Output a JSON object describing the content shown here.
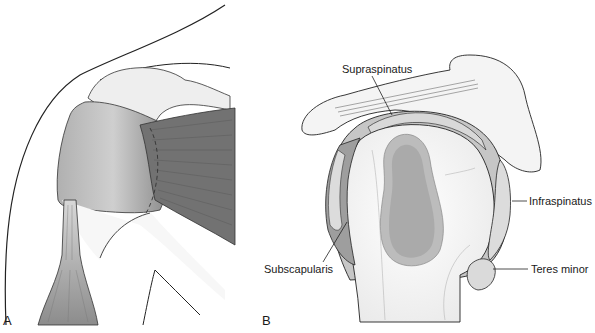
{
  "figure": {
    "panels": [
      {
        "letter": "A",
        "view": "anterior shoulder musculature"
      },
      {
        "letter": "B",
        "view": "lateral view of humeral head with rotator cuff"
      }
    ],
    "labels": {
      "supraspinatus": "Supraspinatus",
      "infraspinatus": "Infraspinatus",
      "subscapularis": "Subscapularis",
      "teres_minor": "Teres minor"
    },
    "colors": {
      "muscle_dark": "#6e6e6e",
      "muscle_mid": "#9a9a9a",
      "bone_light": "#f2f2f2",
      "cartilage": "#b9b9b9",
      "cartilage_inner": "#a8a8a8",
      "outline": "#222222"
    }
  }
}
